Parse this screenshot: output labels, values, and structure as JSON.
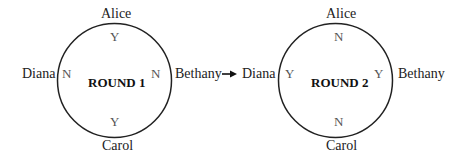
{
  "diagram": {
    "arrow_icon": "right-arrow",
    "rounds": [
      {
        "title": "ROUND 1",
        "people": {
          "top": {
            "name": "Alice",
            "vote": "Y"
          },
          "right": {
            "name": "Bethany",
            "vote": "N"
          },
          "bottom": {
            "name": "Carol",
            "vote": "Y"
          },
          "left": {
            "name": "Diana",
            "vote": "N"
          }
        }
      },
      {
        "title": "ROUND 2",
        "people": {
          "top": {
            "name": "Alice",
            "vote": "N"
          },
          "right": {
            "name": "Bethany",
            "vote": "Y"
          },
          "bottom": {
            "name": "Carol",
            "vote": "N"
          },
          "left": {
            "name": "Diana",
            "vote": "Y"
          }
        }
      }
    ]
  }
}
